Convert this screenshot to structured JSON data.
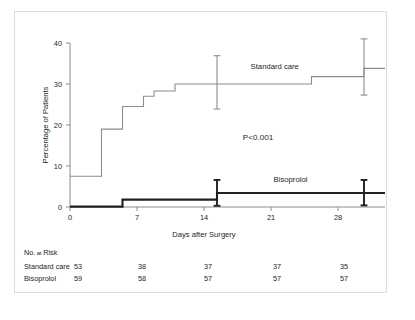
{
  "chart_data": {
    "type": "line",
    "title": "",
    "xlabel": "Days after Surgery",
    "ylabel": "Percentage of Patients",
    "xlim": [
      0,
      30
    ],
    "ylim": [
      0,
      40
    ],
    "xticks": [
      0,
      7,
      14,
      21,
      28
    ],
    "yticks": [
      0,
      10,
      20,
      30,
      40
    ],
    "grid": false,
    "annotation": "P<0.001",
    "legend_position": "inline-on-curves",
    "series": [
      {
        "name": "Standard care",
        "color": "#8c8c8c",
        "style": "step",
        "label_x": 19.5,
        "label_y": 33.6,
        "points": [
          {
            "x": 0,
            "y": 7.5
          },
          {
            "x": 3,
            "y": 7.5
          },
          {
            "x": 3,
            "y": 19.0
          },
          {
            "x": 5,
            "y": 19.0
          },
          {
            "x": 5,
            "y": 24.5
          },
          {
            "x": 7,
            "y": 24.5
          },
          {
            "x": 7,
            "y": 27.0
          },
          {
            "x": 8,
            "y": 27.0
          },
          {
            "x": 8,
            "y": 28.3
          },
          {
            "x": 10,
            "y": 28.3
          },
          {
            "x": 10,
            "y": 30.0
          },
          {
            "x": 23,
            "y": 30.0
          },
          {
            "x": 23,
            "y": 31.8
          },
          {
            "x": 28,
            "y": 31.8
          },
          {
            "x": 28,
            "y": 33.8
          },
          {
            "x": 30,
            "y": 33.8
          }
        ],
        "error_bars": [
          {
            "x": 14,
            "y": 30.0,
            "low": 23.9,
            "high": 36.9
          },
          {
            "x": 28,
            "y": 33.8,
            "low": 27.3,
            "high": 41.0
          }
        ]
      },
      {
        "name": "Bisoprolol",
        "color": "#231f20",
        "style": "step",
        "label_x": 21.0,
        "label_y": 6.2,
        "points": [
          {
            "x": 0,
            "y": 0.1
          },
          {
            "x": 5,
            "y": 0.1
          },
          {
            "x": 5,
            "y": 1.8
          },
          {
            "x": 14,
            "y": 1.8
          },
          {
            "x": 14,
            "y": 3.4
          },
          {
            "x": 30,
            "y": 3.4
          }
        ],
        "error_bars": [
          {
            "x": 14,
            "y": 3.4,
            "low": 0.3,
            "high": 6.6
          },
          {
            "x": 28,
            "y": 3.4,
            "low": 0.4,
            "high": 6.6
          }
        ]
      }
    ]
  },
  "risk_table": {
    "title_main": "No.",
    "title_small": "at",
    "title_rest": "Risk",
    "columns": [
      0,
      7,
      14,
      21,
      28
    ],
    "rows": [
      {
        "label": "Standard care",
        "values": [
          "53",
          "38",
          "37",
          "37",
          "35"
        ]
      },
      {
        "label": "Bisoprolol",
        "values": [
          "59",
          "58",
          "57",
          "57",
          "57"
        ]
      }
    ]
  }
}
